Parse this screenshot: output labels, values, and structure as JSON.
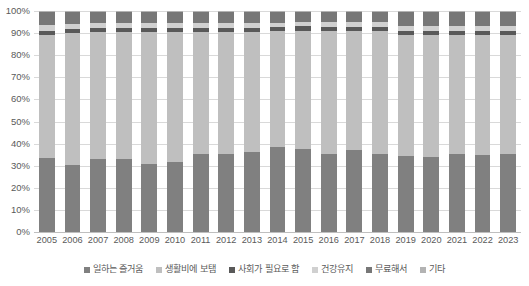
{
  "chart_data": {
    "type": "bar",
    "stacked": true,
    "title": "",
    "subtitle": "",
    "xlabel": "",
    "ylabel": "",
    "ylim": [
      0,
      100
    ],
    "ytick_labels": [
      "100%",
      "90%",
      "80%",
      "70%",
      "60%",
      "50%",
      "40%",
      "30%",
      "20%",
      "10%",
      "0%"
    ],
    "ytick_values": [
      100,
      90,
      80,
      70,
      60,
      50,
      40,
      30,
      20,
      10,
      0
    ],
    "grid": true,
    "legend_position": "bottom",
    "categories": [
      "2005",
      "2006",
      "2007",
      "2008",
      "2009",
      "2010",
      "2011",
      "2012",
      "2013",
      "2014",
      "2015",
      "2016",
      "2017",
      "2018",
      "2019",
      "2020",
      "2021",
      "2022",
      "2023"
    ],
    "series": [
      {
        "name": "일하는 즐거움",
        "color": "#808080",
        "values": [
          33.5,
          30.5,
          33.0,
          33.0,
          31.0,
          31.5,
          35.5,
          35.5,
          36.0,
          38.5,
          37.5,
          35.5,
          37.0,
          35.5,
          35.0,
          34.5,
          36.0,
          35.5,
          36.0
        ]
      },
      {
        "name": "생활비에 보탬",
        "color": "#bfbfbf",
        "values": [
          55.5,
          59.5,
          57.5,
          57.5,
          59.5,
          59.0,
          55.0,
          55.0,
          54.5,
          52.5,
          53.5,
          55.5,
          54.0,
          55.5,
          56.0,
          56.5,
          55.0,
          55.5,
          55.0
        ]
      },
      {
        "name": "사회가 필요로 함",
        "color": "#595959",
        "values": [
          2.0,
          2.0,
          2.0,
          2.0,
          2.0,
          2.0,
          2.0,
          2.0,
          2.0,
          2.0,
          2.0,
          2.0,
          2.0,
          2.0,
          2.0,
          2.0,
          2.0,
          2.0,
          2.0
        ]
      },
      {
        "name": "건강유지",
        "color": "#d0d0d0",
        "values": [
          2.5,
          2.0,
          2.0,
          2.0,
          2.0,
          2.0,
          2.0,
          2.0,
          2.0,
          1.5,
          2.0,
          2.0,
          2.0,
          2.0,
          2.0,
          2.0,
          2.0,
          2.0,
          2.0
        ]
      },
      {
        "name": "무료해서",
        "color": "#777777",
        "values": [
          6.0,
          5.5,
          5.0,
          5.0,
          5.0,
          5.0,
          5.0,
          5.0,
          5.0,
          5.0,
          4.5,
          4.5,
          4.5,
          4.5,
          6.5,
          6.5,
          6.5,
          6.5,
          6.5
        ]
      },
      {
        "name": "기타",
        "color": "#b3b3b3",
        "values": [
          0.5,
          0.5,
          0.5,
          0.5,
          0.5,
          0.5,
          0.5,
          0.5,
          0.5,
          0.5,
          0.5,
          0.5,
          0.5,
          0.5,
          0.5,
          0.5,
          0.5,
          0.5,
          0.5
        ]
      }
    ]
  }
}
